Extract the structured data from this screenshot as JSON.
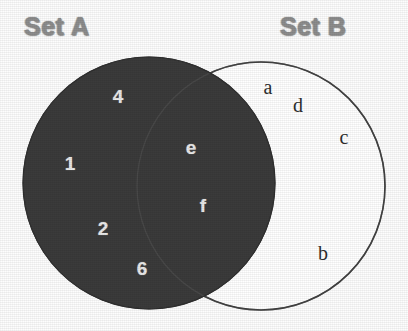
{
  "diagram": {
    "type": "venn",
    "sets": [
      {
        "id": "A",
        "title": "Set A",
        "fill": "#3a3a3a",
        "label_color": "#8d8d8d"
      },
      {
        "id": "B",
        "title": "Set B",
        "fill": "#ffffff",
        "label_color": "#8d8d8d"
      }
    ],
    "background": "#fdfdfd",
    "outline_color": "#2e2e2e"
  },
  "regions": {
    "a_only": {
      "name": "Set A only",
      "elements": [
        {
          "label": "4",
          "x": 118,
          "y": 96
        },
        {
          "label": "1",
          "x": 70,
          "y": 163
        },
        {
          "label": "2",
          "x": 103,
          "y": 228
        },
        {
          "label": "6",
          "x": 142,
          "y": 268
        }
      ]
    },
    "intersection": {
      "name": "A intersect B",
      "elements": [
        {
          "label": "e",
          "x": 191,
          "y": 147
        },
        {
          "label": "f",
          "x": 203,
          "y": 205
        }
      ]
    },
    "b_only": {
      "name": "Set B only",
      "elements": [
        {
          "label": "a",
          "x": 268,
          "y": 87
        },
        {
          "label": "d",
          "x": 298,
          "y": 105
        },
        {
          "label": "c",
          "x": 344,
          "y": 137
        },
        {
          "label": "b",
          "x": 323,
          "y": 253
        }
      ]
    }
  },
  "geometry": {
    "circle_a": {
      "cx": 149,
      "cy": 183,
      "r": 126
    },
    "circle_b": {
      "cx": 261,
      "cy": 186,
      "r": 124
    }
  }
}
